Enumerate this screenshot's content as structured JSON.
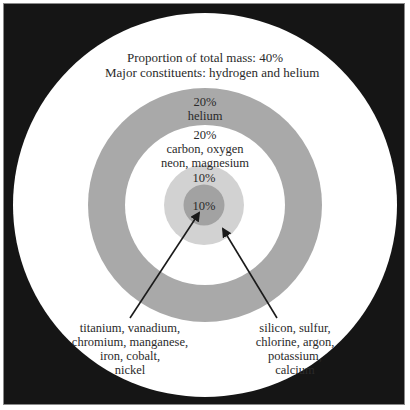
{
  "diagram": {
    "type": "concentric-layers",
    "colors": {
      "background": "#151515",
      "outer_layer": "#ffffff",
      "ring_gray": "#a9a9a9",
      "inner_white": "#ffffff",
      "light_core": "#d2d2d2",
      "dark_core": "#a2a2a2",
      "text": "#2a2a2a"
    },
    "layers": [
      {
        "id": "outer",
        "percent": "40%",
        "lines": [
          "Proportion of total mass: 40%",
          "Major constituents: hydrogen and helium"
        ]
      },
      {
        "id": "ring",
        "lines": [
          "20%",
          "helium"
        ]
      },
      {
        "id": "middle",
        "lines": [
          "20%",
          "carbon, oxygen",
          "neon, magnesium"
        ]
      },
      {
        "id": "light-core",
        "lines": [
          "10%"
        ]
      },
      {
        "id": "dark-core",
        "lines": [
          "10%"
        ]
      }
    ],
    "callouts": {
      "left": {
        "target": "dark-core",
        "lines": [
          "titanium, vanadium,",
          "chromium, manganese,",
          "iron, cobalt,",
          "nickel"
        ]
      },
      "right": {
        "target": "light-core",
        "lines": [
          "silicon, sulfur,",
          "chlorine, argon,",
          "potassium,",
          "calcium"
        ]
      }
    }
  }
}
